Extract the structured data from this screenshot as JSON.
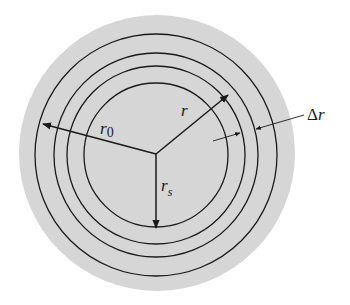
{
  "diagram": {
    "title": "",
    "colors": {
      "background": "#ffffff",
      "disc_fill": "#d6d6d6",
      "stroke": "#1a1a1a"
    },
    "center": {
      "x": 156,
      "y": 154
    },
    "outer_disc_radius": 138,
    "circle_radii": [
      121,
      102,
      89,
      72
    ],
    "labels": {
      "r0": {
        "main": "r",
        "sub": "0"
      },
      "r": {
        "main": "r"
      },
      "rs": {
        "main": "r",
        "sub": "s"
      },
      "delta_r": {
        "main": "Δ",
        "var": "r"
      }
    },
    "arrows": [
      {
        "name": "r0-arrow",
        "from": [
          156,
          154
        ],
        "to": [
          43,
          124
        ]
      },
      {
        "name": "r-arrow",
        "from": [
          156,
          154
        ],
        "to": [
          228,
          95
        ]
      },
      {
        "name": "rs-arrow",
        "from": [
          156,
          154
        ],
        "to": [
          156,
          228
        ]
      },
      {
        "name": "delta-r-inner-arrow",
        "from": [
          213,
          141
        ],
        "to": [
          240,
          133
        ]
      },
      {
        "name": "delta-r-outer-arrow",
        "from": [
          304,
          115
        ],
        "to": [
          256,
          129
        ]
      }
    ]
  }
}
